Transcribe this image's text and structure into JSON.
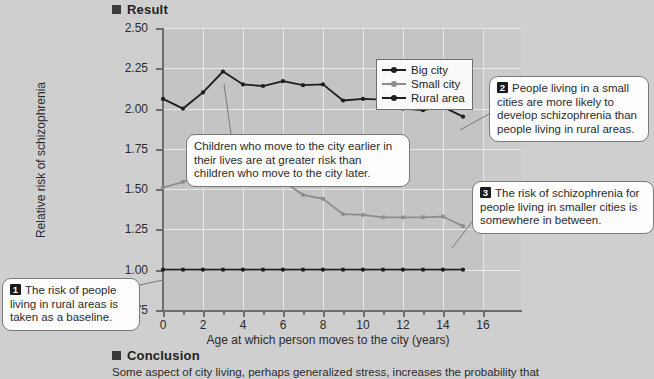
{
  "sections": {
    "result_heading": "Result",
    "conclusion_heading": "Conclusion",
    "conclusion_text": "Some aspect of city living, perhaps generalized stress, increases the probability that"
  },
  "legend": {
    "items": [
      {
        "label": "Big city",
        "color": "#1e1e1e"
      },
      {
        "label": "Small city",
        "color": "#8c8c8c"
      },
      {
        "label": "Rural area",
        "color": "#1e1e1e"
      }
    ]
  },
  "callouts": [
    {
      "num": "1",
      "text": "The risk of people living in rural areas is taken as a baseline."
    },
    {
      "num": "2",
      "text": "People living in a small cities are more likely to develop schizophrenia than people living in rural areas."
    },
    {
      "num": "3",
      "text": "The risk of schizophrenia for people living in smaller cities is somewhere in between."
    }
  ],
  "center_callout": {
    "text": "Children who move to the city earlier in their lives are at greater risk than children who move to the city later."
  },
  "chart_data": {
    "type": "line",
    "title": "",
    "xlabel": "Age at which person moves to the city (years)",
    "ylabel": "Relative risk of schizophrenia",
    "xlim": [
      0,
      16
    ],
    "ylim": [
      0.75,
      2.5
    ],
    "xticks": [
      0,
      2,
      4,
      6,
      8,
      10,
      12,
      14,
      16
    ],
    "xtick_labels": [
      "0",
      "2",
      "4",
      "6",
      "8",
      "10",
      "12",
      "14",
      "16"
    ],
    "yticks": [
      0.75,
      1.0,
      1.25,
      1.5,
      1.75,
      2.0,
      2.25,
      2.5
    ],
    "ytick_labels": [
      "0.75",
      "1.00",
      "1.25",
      "1.50",
      "1.75",
      "2.00",
      "2.25",
      "2.50"
    ],
    "grid": true,
    "legend_position": "top-right",
    "x": [
      0,
      1,
      2,
      3,
      4,
      5,
      6,
      7,
      8,
      9,
      10,
      11,
      12,
      13,
      14,
      15
    ],
    "series": [
      {
        "name": "Big city",
        "color": "#1e1e1e",
        "values": [
          2.06,
          2.0,
          2.1,
          2.23,
          2.15,
          2.14,
          2.17,
          2.145,
          2.15,
          2.05,
          2.06,
          2.055,
          2.0,
          1.99,
          2.01,
          1.95
        ]
      },
      {
        "name": "Small city",
        "color": "#8c8c8c",
        "values": [
          1.51,
          1.545,
          1.6,
          1.61,
          1.61,
          1.58,
          1.55,
          1.465,
          1.44,
          1.345,
          1.34,
          1.325,
          1.325,
          1.325,
          1.33,
          1.27
        ]
      },
      {
        "name": "Rural area",
        "color": "#1e1e1e",
        "values": [
          1.0,
          1.0,
          1.0,
          1.0,
          1.0,
          1.0,
          1.0,
          1.0,
          1.0,
          1.0,
          1.0,
          1.0,
          1.0,
          1.0,
          1.0,
          1.0
        ]
      }
    ]
  }
}
